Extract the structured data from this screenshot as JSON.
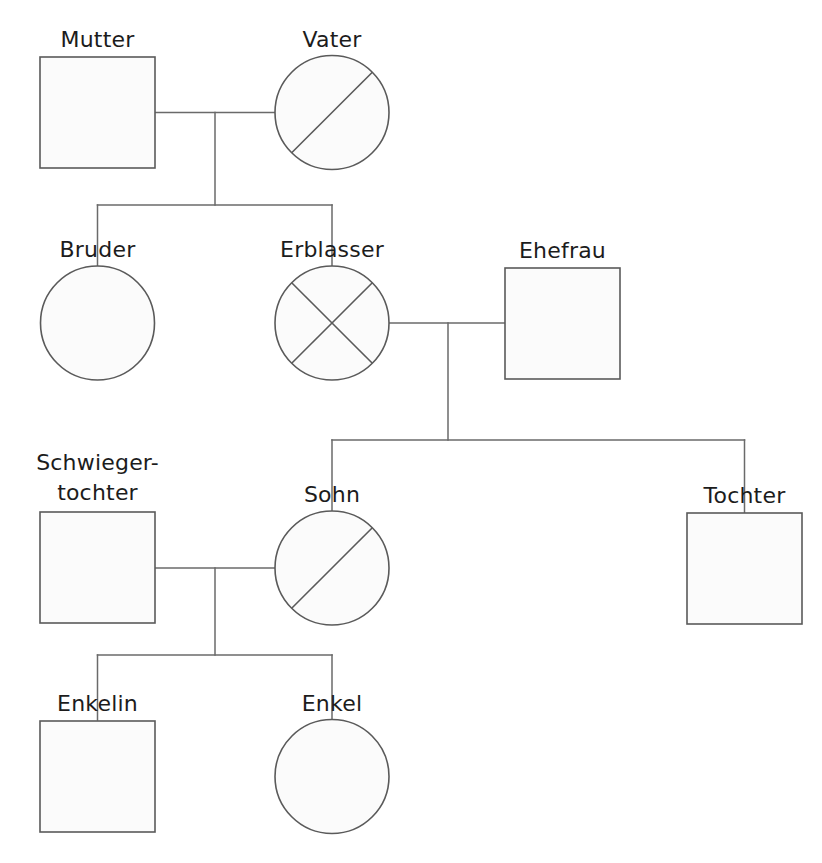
{
  "diagram": {
    "kind": "family-tree-genogram",
    "language": "de",
    "background_color": "#ffffff",
    "line_color": "#6a6a6a",
    "shape_stroke_color": "#5a5a5a",
    "shape_fill_color": "#fbfbfb",
    "label_color": "#1c1c1c",
    "canvas": {
      "width": 822,
      "height": 863
    }
  },
  "legend": {
    "square_meaning": "square",
    "circle_meaning": "circle",
    "single_slash_meaning": "single-diagonal",
    "cross_meaning": "crossed-out"
  },
  "nodes": [
    {
      "id": "mutter",
      "label": "Mutter",
      "shape": "square",
      "mark": "none",
      "generation": 1,
      "x": 97.5,
      "y": 112.5,
      "label_x": 97.5,
      "label_y": 47,
      "box": {
        "left": 40,
        "top": 57,
        "width": 115,
        "height": 111
      }
    },
    {
      "id": "vater",
      "label": "Vater",
      "shape": "circle",
      "mark": "slash",
      "generation": 1,
      "x": 332,
      "y": 112.5,
      "label_x": 332,
      "label_y": 47,
      "radius": 57
    },
    {
      "id": "bruder",
      "label": "Bruder",
      "shape": "circle",
      "mark": "none",
      "generation": 2,
      "x": 97.5,
      "y": 323,
      "label_x": 97.5,
      "label_y": 257,
      "radius": 57
    },
    {
      "id": "erblasser",
      "label": "Erblasser",
      "shape": "circle",
      "mark": "cross",
      "generation": 2,
      "x": 332,
      "y": 323,
      "label_x": 332,
      "label_y": 257,
      "radius": 57
    },
    {
      "id": "ehefrau",
      "label": "Ehefrau",
      "shape": "square",
      "mark": "none",
      "generation": 2,
      "x": 562.5,
      "y": 323,
      "label_x": 562.5,
      "label_y": 258,
      "box": {
        "left": 505,
        "top": 268,
        "width": 115,
        "height": 111
      }
    },
    {
      "id": "schwiegertochter",
      "label": "Schwieger-",
      "label_line2": "tochter",
      "shape": "square",
      "mark": "none",
      "generation": 3,
      "x": 97.5,
      "y": 568,
      "label_x": 97.5,
      "label_y": 470,
      "label2_y": 500,
      "box": {
        "left": 40,
        "top": 512,
        "width": 115,
        "height": 111
      }
    },
    {
      "id": "sohn",
      "label": "Sohn",
      "shape": "circle",
      "mark": "slash",
      "generation": 3,
      "x": 332,
      "y": 568,
      "label_x": 332,
      "label_y": 502,
      "radius": 57
    },
    {
      "id": "tochter",
      "label": "Tochter",
      "shape": "square",
      "mark": "none",
      "generation": 3,
      "x": 744.5,
      "y": 568.5,
      "label_x": 744.5,
      "label_y": 503,
      "box": {
        "left": 687,
        "top": 513,
        "width": 115,
        "height": 111
      }
    },
    {
      "id": "enkelin",
      "label": "Enkelin",
      "shape": "square",
      "mark": "none",
      "generation": 4,
      "x": 97.5,
      "y": 776.5,
      "label_x": 97.5,
      "label_y": 711,
      "box": {
        "left": 40,
        "top": 721,
        "width": 115,
        "height": 111
      }
    },
    {
      "id": "enkel",
      "label": "Enkel",
      "shape": "circle",
      "mark": "none",
      "generation": 4,
      "x": 332,
      "y": 776.5,
      "label_x": 332,
      "label_y": 711,
      "radius": 57
    }
  ],
  "unions": [
    {
      "id": "union-eltern",
      "partners": [
        "mutter",
        "vater"
      ],
      "marriage_line_y": 112.5,
      "marriage_line_x1": 155,
      "marriage_line_x2": 275,
      "drop_x": 215,
      "drop_y1": 112.5,
      "drop_y2": 205,
      "sibling_bar_y": 205,
      "sibling_bar_x1": 97.5,
      "sibling_bar_x2": 332,
      "children": [
        "bruder",
        "erblasser"
      ],
      "child_drop_y2": 266
    },
    {
      "id": "union-erblasser",
      "partners": [
        "erblasser",
        "ehefrau"
      ],
      "marriage_line_y": 323,
      "marriage_line_x1": 389,
      "marriage_line_x2": 505,
      "drop_x": 448,
      "drop_y1": 323,
      "drop_y2": 440,
      "sibling_bar_y": 440,
      "sibling_bar_x1": 332,
      "sibling_bar_x2": 744.5,
      "children": [
        "sohn",
        "tochter"
      ],
      "child_drop_y2_left": 511,
      "child_drop_y2_right": 513
    },
    {
      "id": "union-sohn",
      "partners": [
        "schwiegertochter",
        "sohn"
      ],
      "marriage_line_y": 568,
      "marriage_line_x1": 155,
      "marriage_line_x2": 275,
      "drop_x": 215,
      "drop_y1": 568,
      "drop_y2": 655,
      "sibling_bar_y": 655,
      "sibling_bar_x1": 97.5,
      "sibling_bar_x2": 332,
      "children": [
        "enkelin",
        "enkel"
      ],
      "child_drop_y2": 720
    }
  ]
}
